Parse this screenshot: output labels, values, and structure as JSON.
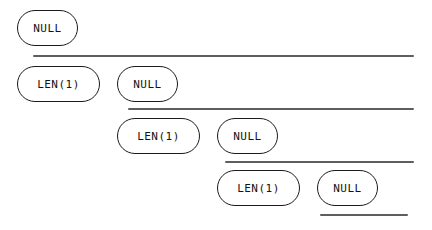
{
  "diagram": {
    "canvas": {
      "width": 432,
      "height": 230,
      "background": "#ffffff"
    },
    "style": {
      "node_stroke": "#1b1b1b",
      "node_fill": "#ffffff",
      "text_color": "#141414",
      "rule_color": "#5e5e5e",
      "font_size_px": 11
    },
    "nodes": [
      {
        "id": "node-1",
        "label": "NULL",
        "row": 1,
        "x": 17,
        "y": 10,
        "w": 61,
        "h": 36
      },
      {
        "id": "node-2",
        "label": "LEN(1)",
        "row": 2,
        "x": 17,
        "y": 66,
        "w": 83,
        "h": 36
      },
      {
        "id": "node-3",
        "label": "NULL",
        "row": 2,
        "x": 117,
        "y": 66,
        "w": 61,
        "h": 36
      },
      {
        "id": "node-4",
        "label": "LEN(1)",
        "row": 3,
        "x": 117,
        "y": 118,
        "w": 83,
        "h": 36
      },
      {
        "id": "node-5",
        "label": "NULL",
        "row": 3,
        "x": 217,
        "y": 118,
        "w": 61,
        "h": 36
      },
      {
        "id": "node-6",
        "label": "LEN(1)",
        "row": 4,
        "x": 217,
        "y": 170,
        "w": 83,
        "h": 36
      },
      {
        "id": "node-7",
        "label": "NULL",
        "row": 4,
        "x": 317,
        "y": 170,
        "w": 61,
        "h": 36
      }
    ],
    "rules": [
      {
        "id": "rule-1",
        "x": 33,
        "y": 55,
        "w": 381
      },
      {
        "id": "rule-2",
        "x": 128,
        "y": 108,
        "w": 286
      },
      {
        "id": "rule-3",
        "x": 225,
        "y": 161,
        "w": 189
      },
      {
        "id": "rule-4",
        "x": 320,
        "y": 214,
        "w": 88
      }
    ]
  }
}
